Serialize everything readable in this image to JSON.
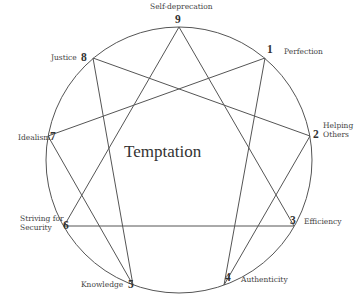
{
  "diagram": {
    "type": "enneagram",
    "center_label": "Temptation",
    "stroke_color": "#555555",
    "circle": {
      "cx": 179,
      "cy": 160,
      "r": 133
    },
    "points": [
      {
        "number": "1",
        "label": "Perfection",
        "x": 265,
        "y": 58
      },
      {
        "number": "2",
        "label": "Helping Others",
        "x": 310,
        "y": 136
      },
      {
        "number": "3",
        "label": "Efficiency",
        "x": 294,
        "y": 226
      },
      {
        "number": "4",
        "label": "Authenticity",
        "x": 224,
        "y": 285
      },
      {
        "number": "5",
        "label": "Knowledge",
        "x": 133,
        "y": 285
      },
      {
        "number": "6",
        "label": "Striving for Security",
        "x": 64,
        "y": 226
      },
      {
        "number": "7",
        "label": "Idealism",
        "x": 48,
        "y": 136
      },
      {
        "number": "8",
        "label": "Justice",
        "x": 93,
        "y": 58
      },
      {
        "number": "9",
        "label": "Self-deprecation",
        "x": 179,
        "y": 27
      }
    ],
    "triangle": [
      "9",
      "3",
      "6"
    ],
    "hexad": [
      "1",
      "4",
      "2",
      "8",
      "5",
      "7"
    ]
  },
  "labels": {
    "p1": "Perfection",
    "p2a": "Helping",
    "p2b": "Others",
    "p3": "Efficiency",
    "p4": "Authenticity",
    "p5": "Knowledge",
    "p6a": "Striving for",
    "p6b": "Security",
    "p7": "Idealism",
    "p8": "Justice",
    "p9": "Self-deprecation"
  },
  "numbers": {
    "n1": "1",
    "n2": "2",
    "n3": "3",
    "n4": "4",
    "n5": "5",
    "n6": "6",
    "n7": "7",
    "n8": "8",
    "n9": "9"
  }
}
